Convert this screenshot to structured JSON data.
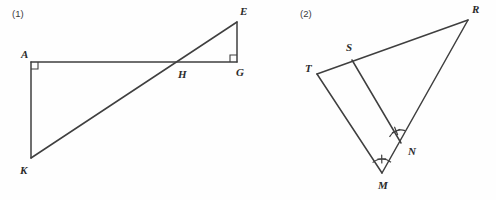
{
  "page": {
    "width": 496,
    "height": 200,
    "background_color": "#fefefe",
    "ink_color": "#3f3f3f",
    "label_color": "#2b2b2b"
  },
  "figures": [
    {
      "number": "(1)",
      "number_pos": {
        "x": 12,
        "y": 17
      },
      "description": "Two right triangles AKH and GEH sharing vertex H on line AG",
      "vertices": [
        {
          "name": "A",
          "x": 31,
          "y": 62,
          "label_x": 21,
          "label_y": 58
        },
        {
          "name": "E",
          "x": 237,
          "y": 22,
          "label_x": 240,
          "label_y": 15
        },
        {
          "name": "G",
          "x": 237,
          "y": 62,
          "label_x": 236,
          "label_y": 76
        },
        {
          "name": "H",
          "x": 180,
          "y": 62,
          "label_x": 178,
          "label_y": 78
        },
        {
          "name": "K",
          "x": 31,
          "y": 158,
          "label_x": 20,
          "label_y": 174
        }
      ],
      "segments": [
        {
          "name": "AG",
          "from": "A",
          "to": "G"
        },
        {
          "name": "AK",
          "from": "A",
          "to": "K"
        },
        {
          "name": "KE",
          "from": "K",
          "to": "E"
        },
        {
          "name": "EG",
          "from": "E",
          "to": "G"
        }
      ],
      "right_angle_marks": [
        {
          "name": "angle-A",
          "at": "A",
          "dx": 1,
          "dy": 1,
          "size": 7
        },
        {
          "name": "angle-G",
          "at": "G",
          "dx": -1,
          "dy": -1,
          "size": 7
        }
      ],
      "angle_marks": []
    },
    {
      "number": "(2)",
      "number_pos": {
        "x": 300,
        "y": 17
      },
      "description": "Triangle TRM with S on TR, N on RM, segment SN drawn, congruent angle marks at N and M",
      "vertices": [
        {
          "name": "T",
          "x": 317,
          "y": 74,
          "label_x": 305,
          "label_y": 72
        },
        {
          "name": "S",
          "x": 352,
          "y": 60,
          "label_x": 346,
          "label_y": 51
        },
        {
          "name": "R",
          "x": 468,
          "y": 20,
          "label_x": 472,
          "label_y": 13
        },
        {
          "name": "N",
          "x": 401,
          "y": 143,
          "label_x": 408,
          "label_y": 155
        },
        {
          "name": "M",
          "x": 382,
          "y": 173,
          "label_x": 378,
          "label_y": 189
        }
      ],
      "segments": [
        {
          "name": "TR",
          "from": "T",
          "to": "R"
        },
        {
          "name": "TM",
          "from": "T",
          "to": "M"
        },
        {
          "name": "RM",
          "from": "R",
          "to": "M"
        },
        {
          "name": "SN",
          "from": "S",
          "to": "N"
        }
      ],
      "right_angle_marks": [],
      "angle_marks": [
        {
          "name": "angle-SNM",
          "at": "N",
          "radius": 13,
          "start_deg": 208,
          "end_deg": 288,
          "tick": true
        },
        {
          "name": "angle-NMT",
          "at": "M",
          "radius": 14,
          "start_deg": 228,
          "end_deg": 310,
          "tick": true
        }
      ]
    }
  ]
}
